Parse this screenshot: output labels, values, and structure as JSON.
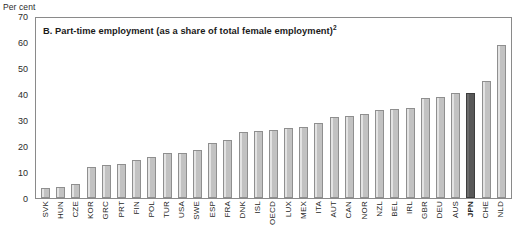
{
  "figure": {
    "panel_letter": "B.",
    "title": "B. Part-time employment (as a share of total female employment)",
    "title_footnote": "2",
    "unit_label": "Per cent"
  },
  "colors": {
    "bar_fill": "#c2c2c2",
    "bar_border": "#8f8f8f",
    "highlight_fill": "#585858",
    "highlight_border": "#3d3d3d",
    "frame": "#8a8a8a",
    "text": "#1a1a1a"
  },
  "chart_data": {
    "type": "bar",
    "title": "B. Part-time employment (as a share of total female employment)2",
    "xlabel": "",
    "ylabel": "Per cent",
    "ylim": [
      0,
      70
    ],
    "yticks": [
      0,
      10,
      20,
      30,
      40,
      50,
      60,
      70
    ],
    "grid": false,
    "legend": "none",
    "highlight_category": "JPN",
    "categories": [
      "SVK",
      "HUN",
      "CZE",
      "KOR",
      "GRC",
      "PRT",
      "FIN",
      "POL",
      "TUR",
      "USA",
      "SWE",
      "ESP",
      "FRA",
      "DNK",
      "ISL",
      "OECD",
      "LUX",
      "MEX",
      "ITA",
      "AUT",
      "CAN",
      "NOR",
      "NZL",
      "BEL",
      "IRL",
      "GBR",
      "DEU",
      "AUS",
      "JPN",
      "CHE",
      "NLD"
    ],
    "values": [
      4.0,
      4.2,
      5.5,
      12.2,
      12.8,
      13.1,
      14.8,
      16.1,
      17.6,
      17.7,
      18.8,
      21.4,
      22.7,
      25.6,
      26.0,
      26.4,
      27.1,
      27.5,
      29.2,
      31.4,
      31.9,
      32.8,
      34.4,
      34.8,
      35.2,
      39.0,
      39.3,
      40.8,
      41.0,
      45.7,
      59.7
    ]
  }
}
